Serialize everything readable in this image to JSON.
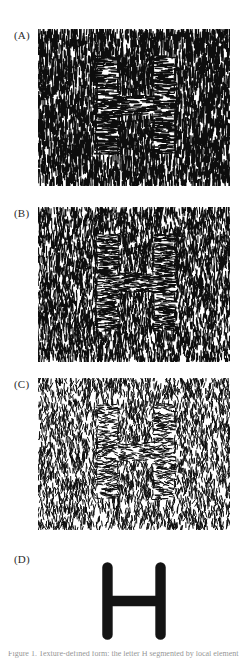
{
  "figure": {
    "background_color": "#ffffff",
    "ink_color": "#0d0d0d",
    "panels": [
      {
        "id": "A",
        "label": "(A)",
        "type": "texture-stimulus",
        "description": "Dense oriented line-segment texture; background elements near-vertical, target region elements near-horizontal forming the letter H",
        "x": 38,
        "y": 29,
        "width": 192,
        "height": 157,
        "element_count": 5200,
        "element_length": 7,
        "element_width": 1.25,
        "background_orientation_deg": 90,
        "target_orientation_deg": 0,
        "orientation_jitter_deg": 8,
        "density": "dense",
        "mean_luminance": "dark"
      },
      {
        "id": "B",
        "label": "(B)",
        "type": "texture-stimulus",
        "description": "Same H target, increased orientation jitter so the figure is less salient",
        "x": 38,
        "y": 207,
        "width": 192,
        "height": 155,
        "element_count": 4600,
        "element_length": 6.5,
        "element_width": 1.1,
        "background_orientation_deg": 90,
        "target_orientation_deg": 0,
        "orientation_jitter_deg": 22,
        "density": "medium-dense",
        "mean_luminance": "medium"
      },
      {
        "id": "C",
        "label": "(C)",
        "type": "texture-stimulus",
        "description": "Same H target, largest orientation jitter and sparsest elements; figure barely detectable",
        "x": 38,
        "y": 378,
        "width": 192,
        "height": 152,
        "element_count": 3600,
        "element_length": 5,
        "element_width": 1.0,
        "background_orientation_deg": 90,
        "target_orientation_deg": 0,
        "orientation_jitter_deg": 42,
        "density": "sparse",
        "mean_luminance": "light"
      },
      {
        "id": "D",
        "label": "(D)",
        "type": "shape-outline",
        "description": "Ground-truth outline of the hidden target: a thick rounded-stroke letter H",
        "x": 86,
        "y": 556,
        "width": 96,
        "height": 90,
        "stroke_color": "#141414",
        "stroke_width": 11,
        "corner_style": "rounded",
        "glyph": "H"
      }
    ],
    "target_shape": {
      "glyph": "H",
      "relative_bounds": {
        "x": 0.31,
        "y": 0.17,
        "width": 0.4,
        "height": 0.63
      },
      "stem_width_fraction": 0.085,
      "crossbar_height_fraction": 0.09
    },
    "caption_fragment": "Figure 1. Texture-defined form: the letter H segmented by local element orientation."
  }
}
